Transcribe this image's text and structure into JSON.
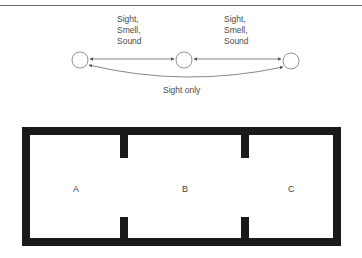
{
  "graph": {
    "nodes": [
      {
        "id": "left",
        "cx": 80,
        "cy": 60,
        "r": 8
      },
      {
        "id": "middle",
        "cx": 184,
        "cy": 60,
        "r": 8
      },
      {
        "id": "right",
        "cx": 291,
        "cy": 61,
        "r": 8
      }
    ],
    "edges": [
      {
        "from": "left",
        "to": "middle",
        "label": "Sight,\nSmell,\nSound"
      },
      {
        "from": "middle",
        "to": "right",
        "label": "Sight,\nSmell,\nSound"
      },
      {
        "from": "left",
        "to": "right",
        "label": "Sight only"
      }
    ],
    "edge_label_left": "Sight,\nSmell,\nSound",
    "edge_label_right": "Sight,\nSmell,\nSound",
    "edge_label_bottom": "Sight only",
    "stroke_color": "#555555"
  },
  "floorplan": {
    "rooms": [
      {
        "label": "A"
      },
      {
        "label": "B"
      },
      {
        "label": "C"
      }
    ],
    "wall_color": "#1a1a1a"
  }
}
